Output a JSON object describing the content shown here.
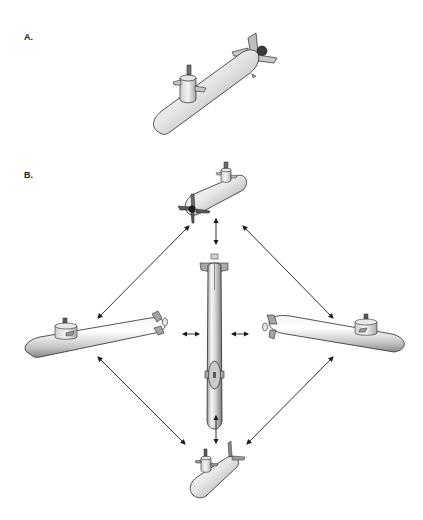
{
  "panels": [
    {
      "label": "A.",
      "description": "Single submarine shown in oblique perspective view",
      "views": [
        {
          "name": "oblique-view",
          "orientation": "diagonal, bow lower-left, stern upper-right"
        }
      ]
    },
    {
      "label": "B.",
      "description": "Multiple submarine views connected by double-headed arrows indicating equivalence of viewpoints",
      "views": [
        {
          "name": "top-view",
          "orientation": "rear oblique, propeller foreground"
        },
        {
          "name": "center-view",
          "orientation": "vertical, top-down plan view"
        },
        {
          "name": "left-view",
          "orientation": "side view, bow left"
        },
        {
          "name": "right-view",
          "orientation": "side view, bow right"
        },
        {
          "name": "bottom-view",
          "orientation": "front oblique, small"
        }
      ],
      "arrows": [
        {
          "from": "top-view",
          "to": "center-view",
          "type": "double-headed"
        },
        {
          "from": "top-view",
          "to": "left-view",
          "type": "double-headed"
        },
        {
          "from": "top-view",
          "to": "right-view",
          "type": "double-headed"
        },
        {
          "from": "left-view",
          "to": "center-view",
          "type": "double-headed"
        },
        {
          "from": "center-view",
          "to": "right-view",
          "type": "double-headed"
        },
        {
          "from": "center-view",
          "to": "bottom-view",
          "type": "double-headed"
        },
        {
          "from": "left-view",
          "to": "bottom-view",
          "type": "double-headed"
        },
        {
          "from": "right-view",
          "to": "bottom-view",
          "type": "double-headed"
        }
      ]
    }
  ],
  "colors": {
    "background": "#ffffff",
    "hull_light": "#f2f2f2",
    "hull_mid": "#c8c8c8",
    "hull_dark": "#8a8a8a",
    "outline": "#2a2a2a",
    "arrow": "#1a1a1a",
    "label": "#1a1a1a"
  }
}
